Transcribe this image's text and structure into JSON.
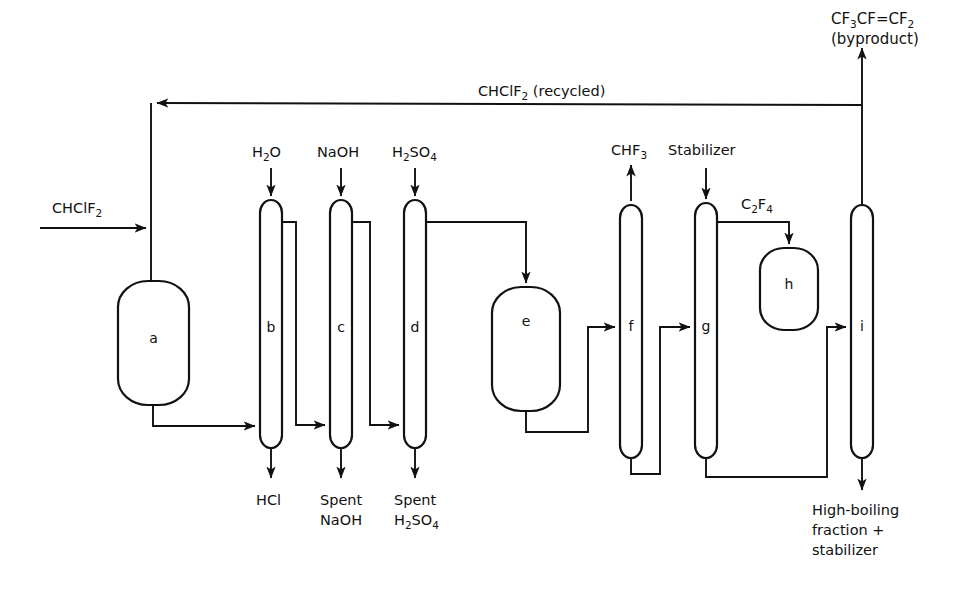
{
  "diagram": {
    "stroke_color": "#111111",
    "background_color": "#ffffff"
  },
  "equipment": [
    {
      "id": "a",
      "tag": "a",
      "kind": "vessel-rounded",
      "name": "pyrolysis-reactor"
    },
    {
      "id": "b",
      "tag": "b",
      "kind": "column",
      "name": "water-scrubber-column"
    },
    {
      "id": "c",
      "tag": "c",
      "kind": "column",
      "name": "caustic-scrubber-column"
    },
    {
      "id": "d",
      "tag": "d",
      "kind": "column",
      "name": "acid-drying-column"
    },
    {
      "id": "e",
      "tag": "e",
      "kind": "vessel-rounded",
      "name": "surge-drum"
    },
    {
      "id": "f",
      "tag": "f",
      "kind": "column",
      "name": "lights-column"
    },
    {
      "id": "g",
      "tag": "g",
      "kind": "column",
      "name": "product-column"
    },
    {
      "id": "h",
      "tag": "h",
      "kind": "vessel-rounded",
      "name": "product-storage-drum"
    },
    {
      "id": "i",
      "tag": "i",
      "kind": "column",
      "name": "heavies-column"
    }
  ],
  "streams": {
    "feed": "CHClF",
    "feed_sub": "2",
    "recycle": "CHClF",
    "recycle_sub": "2",
    "recycle_suffix": " (recycled)",
    "byproduct_line1_a": "CF",
    "byproduct_line1_sub1": "3",
    "byproduct_line1_b": "CF=CF",
    "byproduct_line1_sub2": "2",
    "byproduct_line2": "(byproduct)",
    "water": "H",
    "water_sub": "2",
    "water_tail": "O",
    "caustic": "NaOH",
    "acid": "H",
    "acid_sub1": "2",
    "acid_mid": "SO",
    "acid_sub2": "4",
    "hcl": "HCl",
    "spent_caustic_l1": "Spent",
    "spent_caustic_l2": "NaOH",
    "spent_acid_l1": "Spent",
    "spent_acid_l2a": "H",
    "spent_acid_sub1": "2",
    "spent_acid_l2b": "SO",
    "spent_acid_sub2": "4",
    "chf3": "CHF",
    "chf3_sub": "3",
    "stabilizer": "Stabilizer",
    "c2f4_a": "C",
    "c2f4_sub1": "2",
    "c2f4_b": "F",
    "c2f4_sub2": "4",
    "heavies_l1": "High-boiling",
    "heavies_l2": "fraction +",
    "heavies_l3": "stabilizer"
  }
}
